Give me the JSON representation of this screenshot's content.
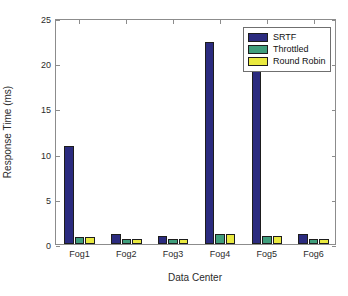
{
  "chart_data": {
    "type": "bar",
    "title": "",
    "xlabel": "Data Center",
    "ylabel": "Response Time (ms)",
    "categories": [
      "Fog1",
      "Fog2",
      "Fog3",
      "Fog4",
      "Fog5",
      "Fog6"
    ],
    "series": [
      {
        "name": "SRTF",
        "color": "#2b2b7f",
        "values": [
          10.8,
          1.15,
          0.9,
          22.3,
          19.4,
          1.1
        ]
      },
      {
        "name": "Throttled",
        "color": "#3f9e7c",
        "values": [
          0.8,
          0.55,
          0.55,
          1.15,
          0.9,
          0.5
        ]
      },
      {
        "name": "Round Robin",
        "color": "#e9e93f",
        "values": [
          0.8,
          0.55,
          0.55,
          1.1,
          0.9,
          0.5
        ]
      }
    ],
    "ylim": [
      0,
      25
    ],
    "yticks": [
      0,
      5,
      10,
      15,
      20,
      25
    ],
    "ytick_labels": [
      "0",
      "5",
      "10",
      "15",
      "20",
      "25"
    ],
    "grid": false,
    "legend_position": "top-right",
    "legend_entries": [
      "SRTF",
      "Throttled",
      "Round Robin"
    ]
  },
  "figure": {
    "background": "#ffffff",
    "axis_color": "#8c8c8c",
    "text_color": "#2b2b2b"
  }
}
